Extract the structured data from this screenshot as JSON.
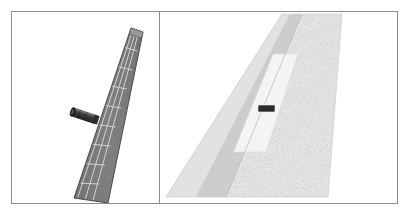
{
  "figure": {
    "width": 410,
    "height": 216,
    "background_color": "#ffffff",
    "frame_color": "#8d8d8d",
    "panel_count": 2
  },
  "panels": [
    {
      "id": "left",
      "name": "coarse-structural-mesh-view",
      "description": "Swept aircraft wing rendered as a coarse quadrilateral panel mesh with an engine nacelle pod protruding from the lower inboard leading edge.",
      "surface_color": "#7b7b7b",
      "surface_shade_dark": "#666666",
      "surface_shade_light": "#949494",
      "gridline_color": "#d8d8d8",
      "outline_color": "#555555",
      "nacelle_color": "#3a3a3a",
      "nacelle_highlight": "#6e6e6e",
      "geometry": {
        "tip_leading_edge": [
          119,
          16
        ],
        "tip_trailing_edge": [
          131,
          20
        ],
        "root_leading_edge": [
          62,
          186
        ],
        "root_trailing_edge": [
          96,
          191
        ]
      },
      "mesh": {
        "spanwise_divisions": 9,
        "chordwise_divisions": 3
      },
      "nacelle": {
        "name": "engine-nacelle-pod",
        "center": [
          73,
          104
        ],
        "length": 24,
        "diameter": 9,
        "angle_deg": 18
      }
    },
    {
      "id": "right",
      "name": "fine-cfd-surface-mesh-view",
      "description": "Planform view of the same wing showing a fine triangulated CFD surface mesh, with a light leading-edge strip, a mid gray spar band, a highlighted light flap/control-surface region and a dark nacelle marker off the leading edge.",
      "fine_mesh_color": "#e6e6e6",
      "fine_mesh_speckle": "#c9c9c9",
      "band_color": "#c4c4c4",
      "leading_strip_color": "#dadada",
      "highlight_patch_color": "#f1f1f1",
      "marker_color": "#2b2b2b",
      "geometry": {
        "tip_leading_edge": [
          122,
          2
        ],
        "tip_trailing_edge": [
          182,
          2
        ],
        "root_leading_edge": [
          6,
          185
        ],
        "root_trailing_edge": [
          168,
          185
        ]
      },
      "marker": {
        "name": "nacelle-location-marker",
        "x": 98,
        "y": 93,
        "width": 17,
        "height": 7
      },
      "highlight_patch": {
        "name": "control-surface-highlight",
        "top": 42,
        "bottom": 140
      }
    }
  ]
}
